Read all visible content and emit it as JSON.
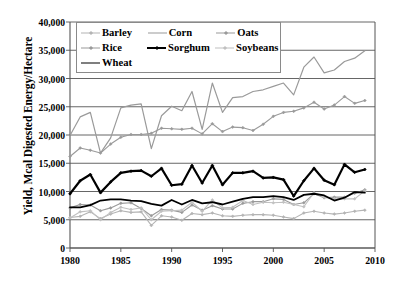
{
  "chart_data": {
    "type": "line",
    "title": "",
    "xlabel": "",
    "ylabel": "Yield, Mcal Digested Energy/Hectare",
    "xlim": [
      1980,
      2010
    ],
    "ylim": [
      0,
      40000
    ],
    "xticks": [
      "1980",
      "1985",
      "1990",
      "1995",
      "2000",
      "2005",
      "2010"
    ],
    "xtick_values": [
      1980,
      1985,
      1990,
      1995,
      2000,
      2005,
      2010
    ],
    "yticks": [
      "0",
      "5,000",
      "10,000",
      "15,000",
      "20,000",
      "25,000",
      "30,000",
      "35,000",
      "40,000"
    ],
    "ytick_values": [
      0,
      5000,
      10000,
      15000,
      20000,
      25000,
      30000,
      35000,
      40000
    ],
    "grid": true,
    "grid_axis": "y",
    "legend_position": "top-left-inside",
    "x": [
      1980,
      1981,
      1982,
      1983,
      1984,
      1985,
      1986,
      1987,
      1988,
      1989,
      1990,
      1991,
      1992,
      1993,
      1994,
      1995,
      1996,
      1997,
      1998,
      1999,
      2000,
      2001,
      2002,
      2003,
      2004,
      2005,
      2006,
      2007,
      2008,
      2009
    ],
    "series": [
      {
        "name": "Barley",
        "color": "#b4b4b4",
        "marker": "diamond",
        "width": 1.1,
        "values": [
          5400,
          5600,
          6400,
          5200,
          6000,
          6600,
          6300,
          6400,
          4000,
          5700,
          5500,
          4900,
          6100,
          5900,
          6200,
          5700,
          5600,
          5800,
          5900,
          5900,
          5800,
          5500,
          5200,
          6200,
          6500,
          6200,
          6000,
          6200,
          6500,
          6700
        ]
      },
      {
        "name": "Corn",
        "color": "#9a9a9a",
        "marker": "none",
        "width": 1.2,
        "values": [
          19900,
          23200,
          24000,
          16800,
          19500,
          24800,
          25300,
          25500,
          17600,
          23400,
          25100,
          24300,
          27700,
          21000,
          29200,
          24000,
          26600,
          26800,
          27700,
          28000,
          28600,
          29200,
          27100,
          32000,
          33800,
          31000,
          31500,
          33000,
          33600,
          34900
        ]
      },
      {
        "name": "Oats",
        "color": "#9a9a9a",
        "marker": "diamond",
        "width": 1.1,
        "values": [
          7100,
          7700,
          7600,
          6600,
          7100,
          7900,
          8000,
          7000,
          5700,
          6800,
          6700,
          6300,
          7600,
          6700,
          7500,
          6900,
          6900,
          7900,
          8200,
          8200,
          8700,
          8600,
          7700,
          8000,
          9600,
          8900,
          9000,
          9000,
          9700,
          10300
        ]
      },
      {
        "name": "Rice",
        "color": "#9a9a9a",
        "marker": "diamond",
        "width": 1.1,
        "values": [
          16200,
          17700,
          17300,
          16800,
          18400,
          19600,
          20100,
          20100,
          20300,
          21200,
          21100,
          21000,
          21200,
          20200,
          22000,
          20600,
          21400,
          21300,
          20800,
          21900,
          23300,
          24000,
          24200,
          24800,
          25800,
          24600,
          25300,
          26800,
          25600,
          26100
        ]
      },
      {
        "name": "Sorghum",
        "color": "#000000",
        "marker": "diamond",
        "width": 2.2,
        "values": [
          9600,
          11900,
          13000,
          9800,
          11700,
          13300,
          13600,
          13700,
          12700,
          14100,
          11100,
          11300,
          14600,
          11500,
          14600,
          11200,
          13300,
          13300,
          13600,
          12400,
          12500,
          12100,
          9200,
          11900,
          14100,
          12000,
          11200,
          14800,
          13400,
          13900
        ]
      },
      {
        "name": "Soybeans",
        "color": "#c0c0c0",
        "marker": "diamond",
        "width": 1.1,
        "values": [
          5300,
          6400,
          6600,
          5000,
          6300,
          7200,
          6800,
          7100,
          5000,
          6500,
          6600,
          6700,
          8100,
          6500,
          8500,
          7100,
          7200,
          8400,
          7700,
          8100,
          8000,
          8100,
          7700,
          7300,
          9800,
          9000,
          8700,
          8700,
          8700,
          10100
        ]
      },
      {
        "name": "Wheat",
        "color": "#000000",
        "marker": "none",
        "width": 1.8,
        "values": [
          7200,
          7200,
          7600,
          8400,
          8600,
          8600,
          8400,
          8300,
          7800,
          7500,
          8500,
          7700,
          8500,
          7900,
          8100,
          7700,
          8200,
          8700,
          9000,
          9000,
          9200,
          9000,
          8500,
          9400,
          9600,
          9300,
          8400,
          8900,
          9900,
          9800
        ]
      }
    ]
  },
  "legend": {
    "rows": [
      [
        {
          "label": "Barley",
          "series": "Barley"
        },
        {
          "label": "Corn",
          "series": "Corn"
        },
        {
          "label": "Oats",
          "series": "Oats"
        }
      ],
      [
        {
          "label": "Rice",
          "series": "Rice"
        },
        {
          "label": "Sorghum",
          "series": "Sorghum"
        },
        {
          "label": "Soybeans",
          "series": "Soybeans"
        }
      ],
      [
        {
          "label": "Wheat",
          "series": "Wheat"
        }
      ]
    ]
  },
  "axis_style": {
    "axis_color": "#555555",
    "grid_color": "#555555",
    "background": "#ffffff"
  }
}
